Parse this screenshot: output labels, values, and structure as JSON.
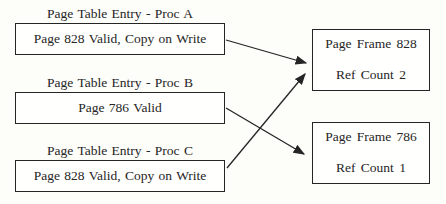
{
  "figure": {
    "colors": {
      "ink": "#252525",
      "paper": "#fdfdfa"
    },
    "page_table_entries": [
      {
        "key": "proc-a",
        "title": "Page Table Entry - Proc A",
        "content": "Page 828 Valid, Copy on Write"
      },
      {
        "key": "proc-b",
        "title": "Page Table Entry - Proc B",
        "content": "Page 786 Valid"
      },
      {
        "key": "proc-c",
        "title": "Page Table Entry - Proc C",
        "content": "Page 828 Valid, Copy on Write"
      }
    ],
    "page_frames": [
      {
        "key": "frame-828",
        "title": "Page Frame 828",
        "subtitle": "Ref Count 2"
      },
      {
        "key": "frame-786",
        "title": "Page Frame 786",
        "subtitle": "Ref Count 1"
      }
    ],
    "arrows": [
      {
        "from": "proc-a",
        "to": "frame-828",
        "x1": 226,
        "y1": 40,
        "x2": 306,
        "y2": 63
      },
      {
        "from": "proc-b",
        "to": "frame-786",
        "x1": 226,
        "y1": 108,
        "x2": 304,
        "y2": 154
      },
      {
        "from": "proc-c",
        "to": "frame-828",
        "x1": 227,
        "y1": 168,
        "x2": 305,
        "y2": 74
      }
    ]
  }
}
